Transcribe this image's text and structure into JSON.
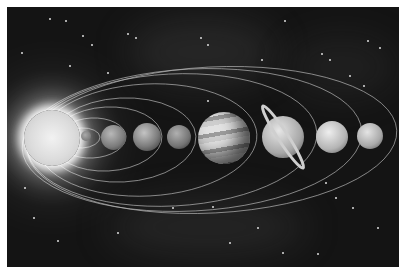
{
  "image": {
    "subject": "Solar system illustration",
    "description": "The Sun on the left with eight planets aligned to the right on elliptical orbits against a starry space background (grayscale)",
    "bodies": [
      {
        "name": "Sun",
        "cx": 45,
        "cy": 131,
        "r": 28
      },
      {
        "name": "Mercury",
        "cx": 86,
        "cy": 136,
        "r": 5
      },
      {
        "name": "Venus",
        "cx": 113,
        "cy": 137,
        "r": 12
      },
      {
        "name": "Earth",
        "cx": 147,
        "cy": 137,
        "r": 14
      },
      {
        "name": "Mars",
        "cx": 179,
        "cy": 137,
        "r": 12
      },
      {
        "name": "Jupiter",
        "cx": 224,
        "cy": 138,
        "r": 26
      },
      {
        "name": "Saturn",
        "cx": 283,
        "cy": 137,
        "r": 21
      },
      {
        "name": "Uranus",
        "cx": 332,
        "cy": 137,
        "r": 16
      },
      {
        "name": "Neptune",
        "cx": 370,
        "cy": 136,
        "r": 13
      }
    ],
    "colors": {
      "background": "#141414",
      "border": "#ffffff",
      "orbit": "#cfcfcf"
    }
  }
}
